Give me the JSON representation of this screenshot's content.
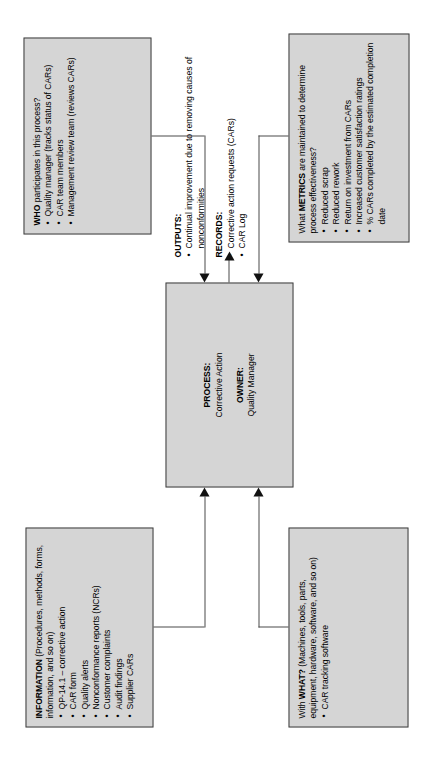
{
  "diagram": {
    "orientation": "rotated-90-ccw",
    "box_fill": "#d5d5d5",
    "box_border": "#3d3d3d",
    "arrow_color": "#111111"
  },
  "who": {
    "heading_strong": "WHO",
    "heading_rest": " participates in this process?",
    "items": [
      "Quality manager (tracks status of CARs)",
      "CAR team members",
      "Management review team (reviews CARs)"
    ]
  },
  "information": {
    "heading_strong": "INFORMATION",
    "heading_rest": " (Procedures, methods, forms, information, and so on)",
    "items": [
      "QP-14.1 – corrective action",
      "CAR form",
      "Quality alerts",
      "Nonconformance reports (NCRs)",
      "Customer complaints",
      "Audit findings",
      "Supplier CARs"
    ]
  },
  "with_what": {
    "heading_pre": "With ",
    "heading_strong": "WHAT?",
    "heading_rest": " (Machines, tools, parts, equipment, hardware, software, and so on)",
    "items": [
      "CAR tracking software"
    ]
  },
  "metrics": {
    "heading_pre": "What ",
    "heading_strong": "METRICS",
    "heading_rest": " are maintained to determine process effectiveness?",
    "items": [
      "Reduced scrap",
      "Reduced rework",
      "Return on investment from CARs",
      "Increased customer satisfaction ratings",
      "% CARs completed by the estimated completion date"
    ]
  },
  "process": {
    "process_label": "PROCESS:",
    "process_value": "Corrective Action",
    "owner_label": "OWNER:",
    "owner_value": "Quality Manager"
  },
  "outputs": {
    "outputs_label": "OUTPUTS:",
    "outputs_items": [
      "Continual improvement due to removing causes of nonconformities"
    ],
    "records_label": "RECORDS:",
    "records_items": [
      "Corrective action requests (CARs)",
      "CAR Log"
    ]
  }
}
